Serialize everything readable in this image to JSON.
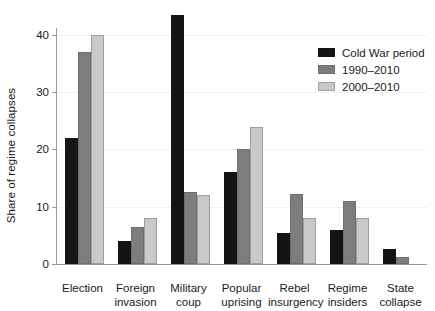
{
  "chart_data": {
    "type": "bar",
    "title": "",
    "xlabel": "",
    "ylabel": "Share of regime collapses",
    "ylim": [
      0,
      44
    ],
    "yticks": [
      0,
      10,
      20,
      30,
      40
    ],
    "grid": true,
    "legend_position": "top-right",
    "categories": [
      "Election",
      "Foreign\ninvasion",
      "Military\ncoup",
      "Popular\nuprising",
      "Rebel\ninsurgency",
      "Regime\ninsiders",
      "State\ncollapse"
    ],
    "series": [
      {
        "name": "Cold War period",
        "color": "#141414",
        "values": [
          22,
          4,
          43.5,
          16,
          5.5,
          6,
          2.7
        ]
      },
      {
        "name": "1990–2010",
        "color": "#7d7d7d",
        "values": [
          37,
          6.5,
          12.5,
          20,
          12.3,
          11,
          1.3
        ]
      },
      {
        "name": "2000–2010",
        "color": "#c9c9c9",
        "values": [
          40,
          8,
          12,
          24,
          8,
          8,
          0
        ]
      }
    ]
  },
  "colors": {
    "background": "#ffffff",
    "axis": "#9a9a9a",
    "gridline": "#f0f0f0",
    "text": "#1a1a1a",
    "series_cold_war": "#141414",
    "series_1990_2010": "#7d7d7d",
    "series_2000_2010": "#c9c9c9"
  }
}
